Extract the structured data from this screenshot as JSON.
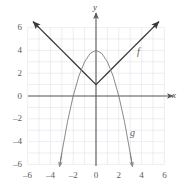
{
  "figure": {
    "axis_x_name": "x",
    "axis_y_name": "y",
    "label_f": "f",
    "label_g": "g"
  },
  "axes": {
    "x_tick_labels": [
      "–6",
      "–4",
      "–2",
      "0",
      "2",
      "4",
      "6"
    ],
    "y_tick_labels": [
      "6",
      "4",
      "2",
      "0",
      "–2",
      "–4",
      "–6"
    ]
  },
  "colors": {
    "grid": "#e3e0ea",
    "axis": "#5a5a5a",
    "curve_f": "#3a3a3a",
    "curve_g": "#7d7d7d",
    "tick_text": "#5c5c5c"
  },
  "chart_data": {
    "type": "line",
    "title": "",
    "xlabel": "x",
    "ylabel": "y",
    "xlim": [
      -6,
      6
    ],
    "ylim": [
      -6,
      6
    ],
    "xticks": [
      -6,
      -4,
      -2,
      0,
      2,
      4,
      6
    ],
    "yticks": [
      -6,
      -4,
      -2,
      0,
      2,
      4,
      6
    ],
    "grid": true,
    "grid_step": 1,
    "legend": "none",
    "annotations": [
      {
        "text": "f",
        "x": 3.9,
        "y": 3.5
      },
      {
        "text": "g",
        "x": 3.3,
        "y": -3.2
      }
    ],
    "series": [
      {
        "name": "f",
        "label": "f",
        "type": "line",
        "equation": "f(x) = |x| + 1",
        "color": "#3a3a3a",
        "arrows": "both",
        "points": [
          {
            "x": -5.5,
            "y": 6.5
          },
          {
            "x": -5.0,
            "y": 6.0
          },
          {
            "x": -4.0,
            "y": 5.0
          },
          {
            "x": -3.0,
            "y": 4.0
          },
          {
            "x": -2.0,
            "y": 3.0
          },
          {
            "x": -1.0,
            "y": 2.0
          },
          {
            "x": 0.0,
            "y": 1.0
          },
          {
            "x": 1.0,
            "y": 2.0
          },
          {
            "x": 2.0,
            "y": 3.0
          },
          {
            "x": 3.0,
            "y": 4.0
          },
          {
            "x": 4.0,
            "y": 5.0
          },
          {
            "x": 5.0,
            "y": 6.0
          },
          {
            "x": 5.5,
            "y": 6.5
          }
        ]
      },
      {
        "name": "g",
        "label": "g",
        "type": "line",
        "equation": "g(x) = 4 – x²",
        "color": "#7d7d7d",
        "arrows": "both",
        "points": [
          {
            "x": -3.2,
            "y": -6.2
          },
          {
            "x": -3.0,
            "y": -5.0
          },
          {
            "x": -2.5,
            "y": -2.25
          },
          {
            "x": -2.0,
            "y": 0.0
          },
          {
            "x": -1.5,
            "y": 1.75
          },
          {
            "x": -1.0,
            "y": 3.0
          },
          {
            "x": -0.5,
            "y": 3.75
          },
          {
            "x": 0.0,
            "y": 4.0
          },
          {
            "x": 0.5,
            "y": 3.75
          },
          {
            "x": 1.0,
            "y": 3.0
          },
          {
            "x": 1.5,
            "y": 1.75
          },
          {
            "x": 2.0,
            "y": 0.0
          },
          {
            "x": 2.5,
            "y": -2.25
          },
          {
            "x": 3.0,
            "y": -5.0
          },
          {
            "x": 3.2,
            "y": -6.2
          }
        ]
      }
    ]
  }
}
